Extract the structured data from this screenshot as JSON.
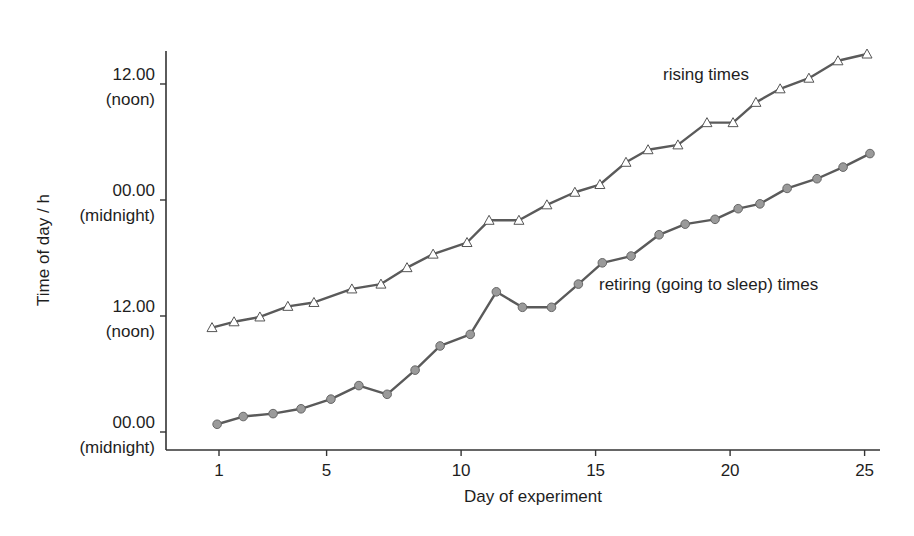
{
  "chart_data": {
    "type": "line",
    "title": "",
    "xlabel": "Day of experiment",
    "ylabel": "Time of day / h",
    "x_ticks": [
      1,
      5,
      10,
      15,
      20,
      25
    ],
    "y_ticks": [
      {
        "hours": 0,
        "label": "00.00",
        "sublabel": "(midnight)"
      },
      {
        "hours": 12,
        "label": "12.00",
        "sublabel": "(noon)"
      },
      {
        "hours": 24,
        "label": "00.00",
        "sublabel": "(midnight)"
      },
      {
        "hours": 36,
        "label": "12.00",
        "sublabel": "(noon)"
      }
    ],
    "xlim": [
      0.2,
      25.5
    ],
    "ylim": [
      -1.9,
      39.4
    ],
    "grid": false,
    "legend": "inline labels",
    "x": [
      1,
      2,
      3,
      4,
      5,
      6,
      7,
      8,
      9,
      10,
      11,
      12,
      13,
      14,
      15,
      16,
      17,
      18,
      19,
      20,
      21,
      22,
      23,
      24,
      25
    ],
    "series": [
      {
        "name": "rising times",
        "marker": "triangle-open",
        "x_offset": [
          0.74,
          1.56,
          2.52,
          3.56,
          4.53,
          5.94,
          7.02,
          7.99,
          8.96,
          10.22,
          11.04,
          12.15,
          13.19,
          14.23,
          15.16,
          16.13,
          16.95,
          18.06,
          19.14,
          20.11,
          20.96,
          21.86,
          22.93,
          24.01,
          25.09
        ],
        "values": [
          10.8,
          11.4,
          11.9,
          13.0,
          13.4,
          14.8,
          15.3,
          17.0,
          18.4,
          19.6,
          21.9,
          21.9,
          23.5,
          24.8,
          25.6,
          27.9,
          29.2,
          29.7,
          32.0,
          32.0,
          34.1,
          35.5,
          36.6,
          38.4,
          39.1
        ]
      },
      {
        "name": "retiring (going to sleep) times",
        "marker": "circle-filled",
        "x_offset": [
          0.93,
          1.9,
          3.01,
          4.05,
          5.16,
          6.2,
          7.25,
          8.29,
          9.22,
          10.34,
          11.31,
          12.28,
          13.36,
          14.36,
          15.25,
          16.32,
          17.36,
          18.33,
          19.44,
          20.3,
          21.11,
          22.12,
          23.23,
          24.2,
          25.2
        ],
        "values": [
          0.8,
          1.6,
          1.9,
          2.4,
          3.4,
          4.8,
          3.9,
          6.4,
          8.9,
          10.1,
          14.5,
          12.9,
          12.9,
          15.3,
          17.5,
          18.2,
          20.4,
          21.5,
          22.0,
          23.1,
          23.6,
          25.2,
          26.2,
          27.4,
          28.8
        ]
      }
    ],
    "annotations": [
      {
        "text": "rising times",
        "near_series": "rising times"
      },
      {
        "text": "retiring (going to sleep) times",
        "near_series": "retiring (going to sleep) times"
      }
    ],
    "colors": {
      "line": "#5a5a5a",
      "circle_fill": "#9a9a9a",
      "triangle_fill": "#ffffff",
      "axis": "#333333"
    }
  }
}
